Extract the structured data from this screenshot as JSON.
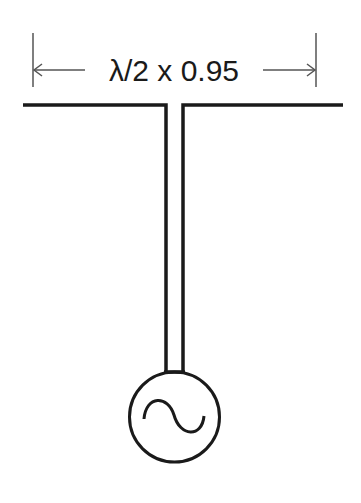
{
  "diagram": {
    "dimension_label": "λ/2 x 0.95",
    "components": [
      {
        "name": "dipole-element",
        "description": "Horizontal radiator split at center"
      },
      {
        "name": "feed-line",
        "description": "Two-wire transmission line"
      },
      {
        "name": "ac-source",
        "description": "AC signal generator symbol (circle with sine wave)"
      }
    ],
    "colors": {
      "line": "#1a1a1a",
      "dimension": "#555555",
      "background": "#ffffff"
    }
  }
}
